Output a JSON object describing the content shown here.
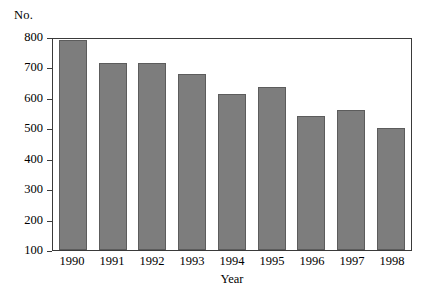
{
  "chart_data": {
    "type": "bar",
    "title": "",
    "subtitle": "",
    "xlabel": "Year",
    "ylabel": "No.",
    "categories": [
      "1990",
      "1991",
      "1992",
      "1993",
      "1994",
      "1995",
      "1996",
      "1997",
      "1998"
    ],
    "values": [
      790,
      715,
      715,
      680,
      612,
      635,
      540,
      560,
      500
    ],
    "series": [
      {
        "name": "No.",
        "values": [
          790,
          715,
          715,
          680,
          612,
          635,
          540,
          560,
          500
        ]
      }
    ],
    "ylim": [
      100,
      800
    ],
    "ytick_labels": [
      "800",
      "700",
      "600",
      "500",
      "400",
      "300",
      "200",
      "100"
    ],
    "ytick_values": [
      800,
      700,
      600,
      500,
      400,
      300,
      200,
      100
    ],
    "xtick_labels": [
      "1990",
      "1991",
      "1992",
      "1993",
      "1994",
      "1995",
      "1996",
      "1997",
      "1998"
    ],
    "grid": false,
    "legend": false,
    "legend_position": "none",
    "annotations": [],
    "colors": {
      "bar_fill": "#7d7d7d",
      "bar_edge": "#5c5c5c",
      "axis": "#3a3a3a",
      "text": "#000000",
      "background": "#ffffff"
    }
  },
  "axes": {
    "y_unit_label": "No.",
    "x_title": "Year"
  }
}
